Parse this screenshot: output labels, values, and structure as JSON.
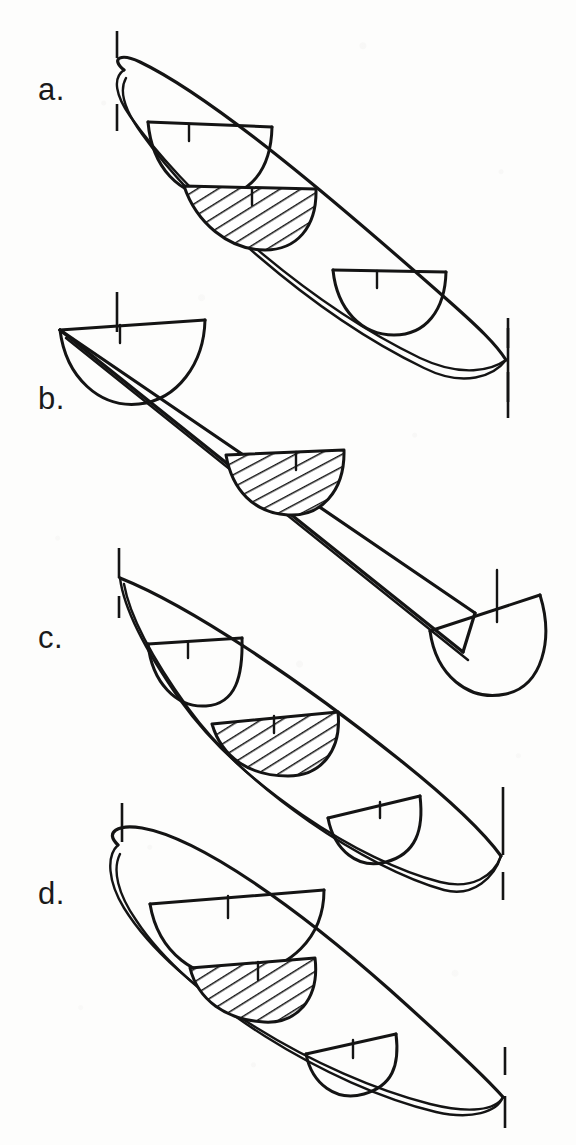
{
  "figure": {
    "kind": "technical-line-drawing",
    "background_color": "#fdfdfc",
    "ink_color": "#141414",
    "panel_count": 4,
    "panels": [
      {
        "id": "a",
        "label": "a.",
        "label_x": 38,
        "label_y": 74,
        "form": "double-ended hull, rounded bow, fine pointed stern",
        "bow_end": "rounded",
        "stern_end": "pointed",
        "cross_sections": 3,
        "hatched_section_index": 2,
        "hatched_section_position": "amidships",
        "reference_ticks": 4
      },
      {
        "id": "b",
        "label": "b.",
        "label_x": 38,
        "label_y": 383,
        "form": "straight prismatic trough, open semicircular ends",
        "bow_end": "open-semicircular",
        "stern_end": "open-semicircular",
        "cross_sections": 2,
        "hatched_section_index": 1,
        "hatched_section_position": "amidships",
        "reference_ticks": 4
      },
      {
        "id": "c",
        "label": "c.",
        "label_x": 38,
        "label_y": 622,
        "form": "double-ended hull, sharp pointed bow and stern",
        "bow_end": "pointed",
        "stern_end": "pointed",
        "cross_sections": 3,
        "hatched_section_index": 2,
        "hatched_section_position": "amidships",
        "reference_ticks": 4
      },
      {
        "id": "d",
        "label": "d.",
        "label_x": 38,
        "label_y": 878,
        "form": "asymmetric hull, broad rounded bow, fine pointed stern",
        "bow_end": "rounded-broad",
        "stern_end": "pointed",
        "cross_sections": 3,
        "hatched_section_index": 2,
        "hatched_section_position": "amidships",
        "reference_ticks": 4
      }
    ],
    "legend_notes": {
      "hatched_meaning": "midship cross-section, hatched",
      "tick_meaning": "vertical reference / station tick marks at bow and stern",
      "centerline_tick_meaning": "short centreline tick on each transverse section"
    }
  }
}
